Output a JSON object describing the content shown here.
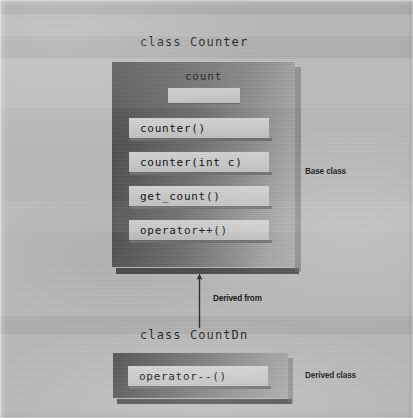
{
  "figure": {
    "width": 413,
    "height": 418
  },
  "base_class": {
    "title": "class Counter",
    "annotation": "Base class",
    "member_data": {
      "label": "count",
      "value": ""
    },
    "methods": [
      "counter()",
      "counter(int c)",
      "get_count()",
      "operator++()"
    ]
  },
  "derivation": {
    "label": "Derived from",
    "arrow_icon": "arrow-up-icon",
    "direction": "up"
  },
  "derived_class": {
    "title": "class CountDn",
    "annotation": "Derived class",
    "methods": [
      "operator--()"
    ]
  },
  "colors": {
    "page_background": "#b9b9b9",
    "box_dark": "#4a4a4a",
    "box_light": "#ababab",
    "member_box": "#c8c8c8",
    "shadow": "#4d4d4d",
    "text": "#141414"
  }
}
